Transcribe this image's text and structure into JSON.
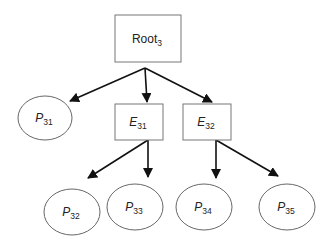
{
  "diagram": {
    "type": "tree",
    "colors": {
      "box_stroke": "#777777",
      "ellipse_stroke": "#555555",
      "edge": "#111111",
      "text": "#222222",
      "background": "#ffffff"
    },
    "root": {
      "id": "root3",
      "shape": "rectangle",
      "label_main": "Root",
      "label_sub": "3"
    },
    "nodes": [
      {
        "id": "p31",
        "shape": "ellipse",
        "label_main": "P",
        "label_sub": "31"
      },
      {
        "id": "e31",
        "shape": "rectangle",
        "label_main": "E",
        "label_sub": "31"
      },
      {
        "id": "e32",
        "shape": "rectangle",
        "label_main": "E",
        "label_sub": "32"
      },
      {
        "id": "p32",
        "shape": "ellipse",
        "label_main": "P",
        "label_sub": "32"
      },
      {
        "id": "p33",
        "shape": "ellipse",
        "label_main": "P",
        "label_sub": "33"
      },
      {
        "id": "p34",
        "shape": "ellipse",
        "label_main": "P",
        "label_sub": "34"
      },
      {
        "id": "p35",
        "shape": "ellipse",
        "label_main": "P",
        "label_sub": "35"
      }
    ],
    "edges": [
      {
        "from": "root3",
        "to": "p31"
      },
      {
        "from": "root3",
        "to": "e31"
      },
      {
        "from": "root3",
        "to": "e32"
      },
      {
        "from": "e31",
        "to": "p32"
      },
      {
        "from": "e31",
        "to": "p33"
      },
      {
        "from": "e32",
        "to": "p34"
      },
      {
        "from": "e32",
        "to": "p35"
      }
    ]
  }
}
